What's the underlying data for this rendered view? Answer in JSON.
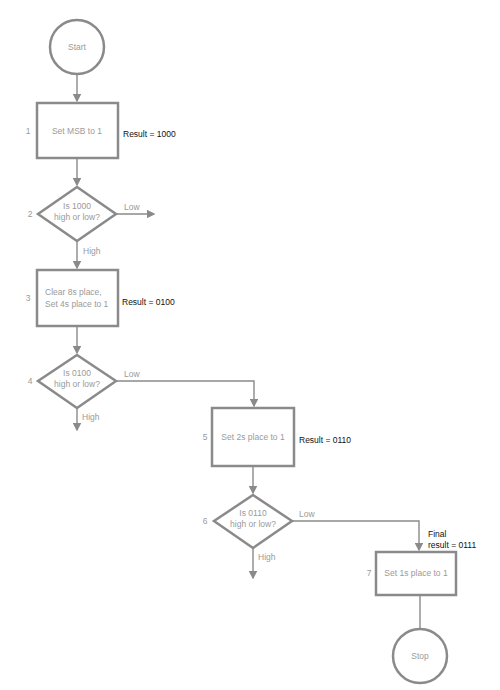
{
  "flowchart": {
    "start": "Start",
    "stop": "Stop",
    "steps": [
      {
        "num": "1",
        "lines": [
          "Set MSB to 1"
        ],
        "result": "Result = 1000"
      },
      {
        "num": "2",
        "lines": [
          "Is 1000",
          "high or low?"
        ],
        "yes": "High",
        "no": "Low"
      },
      {
        "num": "3",
        "lines": [
          "Clear 8s place,",
          "Set 4s place to 1"
        ],
        "result": "Result = 0100"
      },
      {
        "num": "4",
        "lines": [
          "Is 0100",
          "high or low?"
        ],
        "yes": "High",
        "no": "Low"
      },
      {
        "num": "5",
        "lines": [
          "Set 2s place to 1"
        ],
        "result": "Result = 0110"
      },
      {
        "num": "6",
        "lines": [
          "Is 0110",
          "high or low?"
        ],
        "yes": "High",
        "no": "Low"
      },
      {
        "num": "7",
        "lines": [
          "Set 1s place to 1"
        ],
        "result_lines": [
          "Final",
          "result = 0111"
        ]
      }
    ]
  }
}
